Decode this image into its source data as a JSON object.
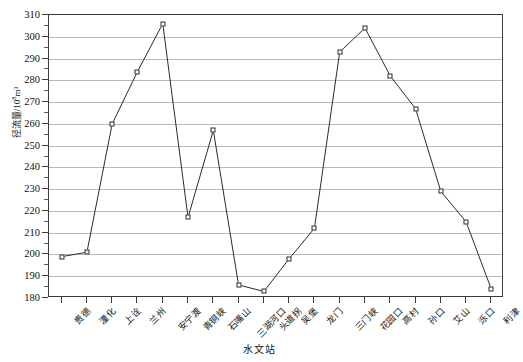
{
  "chart_data": {
    "type": "line",
    "title": "",
    "xlabel": "水文站",
    "ylabel": "径流量/10⁸m³",
    "ylabel_main": "径流量/10",
    "ylabel_exp": "8",
    "ylabel_unit": "m³",
    "ylim": [
      180,
      310
    ],
    "ytick_step": 10,
    "yticks": [
      180,
      190,
      200,
      210,
      220,
      230,
      240,
      250,
      260,
      270,
      280,
      290,
      300,
      310
    ],
    "grid": true,
    "legend": "none",
    "categories": [
      "贵德",
      "潼化",
      "上诠",
      "兰州",
      "安宁渡",
      "青铜峡",
      "石嘴山",
      "三湖河口",
      "头道拐",
      "吴堡",
      "龙门",
      "三门峡",
      "花园口",
      "高村",
      "孙口",
      "艾山",
      "泺口",
      "利津"
    ],
    "values": [
      199,
      201,
      260,
      284,
      306,
      217,
      257,
      186,
      183,
      198,
      212,
      293,
      304,
      282,
      267,
      229,
      215,
      184
    ],
    "series": [
      {
        "name": "径流量",
        "marker": "open-square",
        "values": [
          199,
          201,
          260,
          284,
          306,
          217,
          257,
          186,
          183,
          198,
          212,
          293,
          304,
          282,
          267,
          229,
          215,
          184
        ]
      }
    ]
  },
  "colors": {
    "axis": "#3a3a3a",
    "grid": "#b9b9b9",
    "line": "#2b2b2b",
    "marker_fill": "#ffffff",
    "background": "#ffffff"
  }
}
